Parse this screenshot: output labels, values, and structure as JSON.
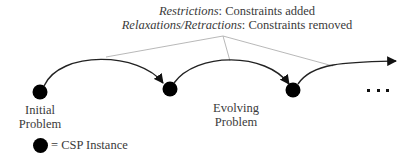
{
  "header": {
    "line1": {
      "term": "Restrictions",
      "rest": ": Constraints added"
    },
    "line2": {
      "term": "Relaxations/Retractions",
      "rest": ": Constraints removed"
    }
  },
  "nodes": [
    {
      "id": "n1",
      "label_line1": "Initial",
      "label_line2": "Problem"
    },
    {
      "id": "n2",
      "label_line1": "",
      "label_line2": ""
    },
    {
      "id": "n3",
      "label_line1": "",
      "label_line2": ""
    }
  ],
  "middle_label": {
    "line1": "Evolving",
    "line2": "Problem"
  },
  "continuation": "...",
  "legend": {
    "text": "= CSP Instance"
  },
  "colors": {
    "node": "#000000",
    "arc": "#222222",
    "guide_line": "#aaaaaa",
    "text": "#3a3a3a"
  }
}
